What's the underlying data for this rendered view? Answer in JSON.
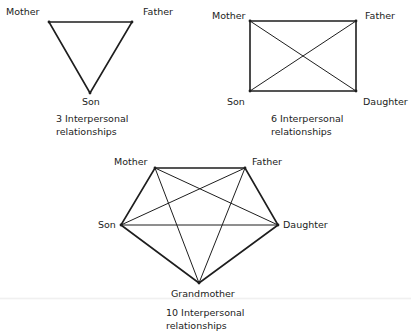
{
  "diagrams": [
    {
      "id": "triangle",
      "caption": [
        "3 Interpersonal",
        "relationships"
      ],
      "caption_pos": [
        56,
        112
      ],
      "nodes": [
        {
          "name": "Mother",
          "x": 49,
          "y": 22,
          "lx": 6,
          "ly": 6
        },
        {
          "name": "Father",
          "x": 132,
          "y": 22,
          "lx": 143,
          "ly": 6
        },
        {
          "name": "Son",
          "x": 90,
          "y": 93,
          "lx": 82,
          "ly": 96
        }
      ],
      "edges": [
        [
          0,
          1
        ],
        [
          1,
          2
        ],
        [
          2,
          0
        ]
      ],
      "edge_count": 3
    },
    {
      "id": "rectangle",
      "caption": [
        "6 Interpersonal",
        "relationships"
      ],
      "caption_pos": [
        271,
        112
      ],
      "nodes": [
        {
          "name": "Mother",
          "x": 250,
          "y": 21,
          "lx": 212,
          "ly": 10
        },
        {
          "name": "Father",
          "x": 356,
          "y": 21,
          "lx": 365,
          "ly": 10
        },
        {
          "name": "Son",
          "x": 250,
          "y": 91,
          "lx": 227,
          "ly": 96
        },
        {
          "name": "Daughter",
          "x": 356,
          "y": 91,
          "lx": 363,
          "ly": 96
        }
      ],
      "edges": [
        [
          0,
          1
        ],
        [
          1,
          3
        ],
        [
          3,
          2
        ],
        [
          2,
          0
        ],
        [
          0,
          3
        ],
        [
          1,
          2
        ]
      ],
      "edge_count": 6
    },
    {
      "id": "pentagon",
      "caption": [
        "10 Interpersonal",
        "relationships"
      ],
      "caption_pos": [
        166,
        306
      ],
      "nodes": [
        {
          "name": "Mother",
          "x": 155,
          "y": 168,
          "lx": 114,
          "ly": 156
        },
        {
          "name": "Father",
          "x": 245,
          "y": 168,
          "lx": 252,
          "ly": 156
        },
        {
          "name": "Son",
          "x": 121,
          "y": 225,
          "lx": 98,
          "ly": 219
        },
        {
          "name": "Daughter",
          "x": 278,
          "y": 225,
          "lx": 283,
          "ly": 219
        },
        {
          "name": "Grandmother",
          "x": 199,
          "y": 283,
          "lx": 171,
          "ly": 288
        }
      ],
      "edges": [
        [
          0,
          1
        ],
        [
          1,
          3
        ],
        [
          3,
          4
        ],
        [
          4,
          2
        ],
        [
          2,
          0
        ],
        [
          0,
          3
        ],
        [
          0,
          4
        ],
        [
          1,
          2
        ],
        [
          1,
          4
        ],
        [
          2,
          3
        ]
      ],
      "edge_count": 10
    }
  ],
  "style": {
    "line_color": "#1e1e1e",
    "outer_stroke": 1.6,
    "inner_stroke": 1.0
  }
}
